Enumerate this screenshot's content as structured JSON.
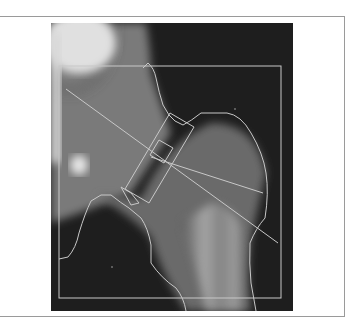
{
  "figure": {
    "type": "DXA hip scan",
    "colors": {
      "background": "#ffffff",
      "frame_border": "#9a9a9a",
      "overlay_lines": "#c8c8c8",
      "scan_dark": "#1e1e1e"
    },
    "overlays": [
      "roi-bounding-box",
      "femur-contour",
      "neck-box",
      "ward-box",
      "axis-lines"
    ]
  }
}
